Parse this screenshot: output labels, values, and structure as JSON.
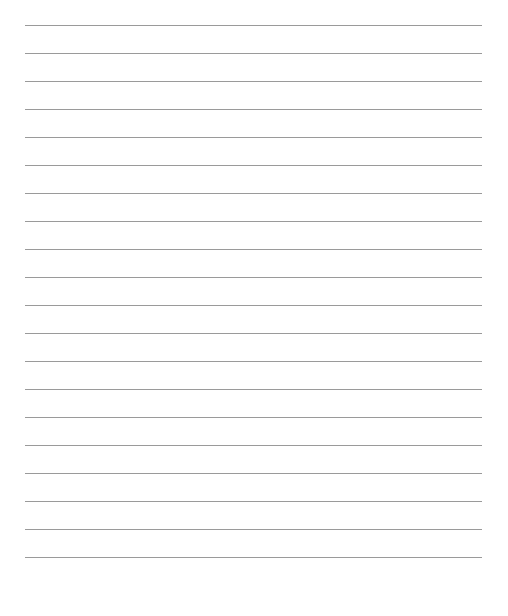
{
  "page": {
    "type": "lined-paper",
    "line_count": 20,
    "first_line_y": 25,
    "line_spacing": 28,
    "line_left": 25,
    "line_width": 457,
    "line_color": "#9a9a9a",
    "background_color": "#ffffff"
  }
}
